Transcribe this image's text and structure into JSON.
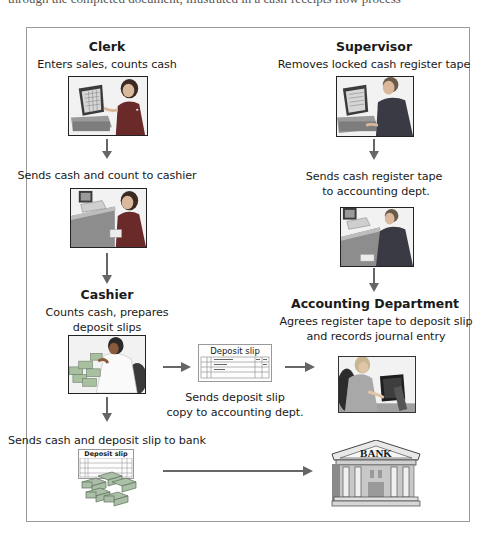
{
  "header": {
    "cut_off_text": "through the completed document, illustrated in a cash-receipts flow process"
  },
  "diagram": {
    "type": "flowchart",
    "colors": {
      "frame": "#9a9a9a",
      "arrow": "#666666",
      "text": "#1a1a1a"
    },
    "left_column": {
      "clerk": {
        "title": "Clerk",
        "description": "Enters sales, counts cash",
        "icon": "clerk-at-register-image"
      },
      "step_to_cashier": {
        "description": "Sends cash and count to cashier",
        "icon": "clerk-handing-cash-image"
      },
      "cashier": {
        "title": "Cashier",
        "description_line1": "Counts cash, prepares",
        "description_line2": "deposit slips",
        "icon": "cashier-counting-cash-image"
      },
      "step_to_bank": {
        "description": "Sends cash and deposit slip to bank",
        "icon": "deposit-slip-with-cash-image",
        "slip_title": "Deposit slip"
      }
    },
    "middle": {
      "deposit_slip": {
        "slip_title": "Deposit slip",
        "description_line1": "Sends deposit slip",
        "description_line2": "copy to accounting dept."
      }
    },
    "right_column": {
      "supervisor": {
        "title": "Supervisor",
        "description": "Removes locked cash register tape",
        "icon": "supervisor-at-register-image"
      },
      "step_to_accounting": {
        "description_line1": "Sends cash register tape",
        "description_line2": "to accounting dept.",
        "icon": "supervisor-with-tape-image"
      },
      "accounting": {
        "title": "Accounting Department",
        "description_line1": "Agrees register tape to deposit slip",
        "description_line2": "and records journal entry",
        "icon": "accountant-at-computer-image"
      },
      "bank": {
        "label": "BANK",
        "icon": "bank-building-icon"
      }
    },
    "flows": [
      {
        "from": "Clerk",
        "to": "Cashier",
        "direction": "down"
      },
      {
        "from": "Cashier",
        "to": "Deposit slip",
        "direction": "right"
      },
      {
        "from": "Deposit slip",
        "to": "Accounting Department",
        "direction": "right"
      },
      {
        "from": "Cashier",
        "to": "Bank (via deposit)",
        "direction": "down"
      },
      {
        "from": "Deposit + cash",
        "to": "Bank",
        "direction": "right"
      },
      {
        "from": "Supervisor",
        "to": "Accounting Department",
        "direction": "down"
      }
    ]
  }
}
